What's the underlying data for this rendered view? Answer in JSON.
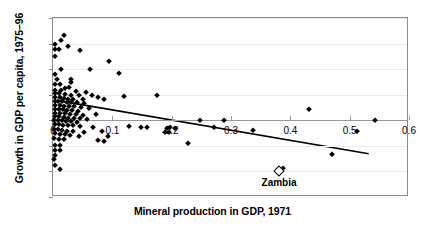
{
  "chart_data": {
    "type": "scatter",
    "title": "",
    "xlabel": "Mineral production in GDP, 1971",
    "ylabel": "Growth in GDP per capita, 1975–96",
    "xlim": [
      0,
      0.6
    ],
    "ylim": [
      -6,
      8
    ],
    "xticks": [
      "0",
      "0.1",
      "0.2",
      "0.3",
      "0.4",
      "0.5",
      "0.6"
    ],
    "xtick_values": [
      0,
      0.1,
      0.2,
      0.3,
      0.4,
      0.5,
      0.6
    ],
    "yticks": [
      "-6",
      "-4",
      "-2",
      "0",
      "2",
      "4",
      "6",
      "8"
    ],
    "ytick_values": [
      -6,
      -4,
      -2,
      0,
      2,
      4,
      6,
      8
    ],
    "grid": true,
    "legend": "none",
    "marker": "filled-diamond",
    "point_color": "#000000",
    "trendline": {
      "style": "solid",
      "color": "#000000",
      "x0": 0.011,
      "y0": 1.52,
      "x1": 0.532,
      "y1": -2.62
    },
    "annotations": [
      {
        "name": "Zambia",
        "x": 0.381,
        "y": -4.0,
        "marker": "hollow-diamond"
      }
    ],
    "points": [
      [
        0.004,
        6.0
      ],
      [
        0.013,
        6.3
      ],
      [
        0.019,
        6.7
      ],
      [
        0.025,
        5.8
      ],
      [
        0.004,
        5.6
      ],
      [
        0.01,
        5.6
      ],
      [
        0.046,
        5.5
      ],
      [
        0.003,
        5.0
      ],
      [
        0.095,
        4.6
      ],
      [
        0.004,
        3.6
      ],
      [
        0.013,
        4.0
      ],
      [
        0.062,
        4.0
      ],
      [
        0.112,
        3.7
      ],
      [
        0.006,
        3.2
      ],
      [
        0.03,
        3.2
      ],
      [
        0.031,
        3.0
      ],
      [
        0.004,
        2.8
      ],
      [
        0.012,
        2.8
      ],
      [
        0.027,
        2.6
      ],
      [
        0.02,
        2.5
      ],
      [
        0.004,
        2.4
      ],
      [
        0.013,
        2.4
      ],
      [
        0.038,
        2.3
      ],
      [
        0.055,
        2.25
      ],
      [
        0.003,
        2.1
      ],
      [
        0.01,
        2.1
      ],
      [
        0.021,
        2.05
      ],
      [
        0.03,
        2.0
      ],
      [
        0.044,
        2.0
      ],
      [
        0.065,
        1.95
      ],
      [
        0.12,
        1.9
      ],
      [
        0.175,
        1.95
      ],
      [
        0.004,
        1.8
      ],
      [
        0.011,
        1.8
      ],
      [
        0.018,
        1.75
      ],
      [
        0.026,
        1.7
      ],
      [
        0.034,
        1.7
      ],
      [
        0.05,
        1.65
      ],
      [
        0.075,
        1.8
      ],
      [
        0.086,
        1.7
      ],
      [
        0.003,
        1.5
      ],
      [
        0.009,
        1.5
      ],
      [
        0.016,
        1.5
      ],
      [
        0.023,
        1.45
      ],
      [
        0.03,
        1.4
      ],
      [
        0.04,
        1.4
      ],
      [
        0.052,
        1.35
      ],
      [
        0.004,
        1.2
      ],
      [
        0.011,
        1.2
      ],
      [
        0.018,
        1.15
      ],
      [
        0.027,
        1.1
      ],
      [
        0.036,
        1.1
      ],
      [
        0.048,
        1.05
      ],
      [
        0.06,
        1.0
      ],
      [
        0.003,
        0.9
      ],
      [
        0.01,
        0.9
      ],
      [
        0.017,
        0.85
      ],
      [
        0.024,
        0.8
      ],
      [
        0.032,
        0.8
      ],
      [
        0.042,
        0.75
      ],
      [
        0.432,
        0.9
      ],
      [
        0.004,
        0.6
      ],
      [
        0.012,
        0.6
      ],
      [
        0.02,
        0.55
      ],
      [
        0.028,
        0.5
      ],
      [
        0.038,
        0.5
      ],
      [
        0.05,
        0.45
      ],
      [
        0.072,
        0.5
      ],
      [
        0.003,
        0.3
      ],
      [
        0.01,
        0.3
      ],
      [
        0.018,
        0.25
      ],
      [
        0.026,
        0.2
      ],
      [
        0.035,
        0.2
      ],
      [
        0.045,
        0.15
      ],
      [
        0.058,
        0.1
      ],
      [
        0.002,
        0.05
      ],
      [
        0.008,
        0.0
      ],
      [
        0.015,
        0.0
      ],
      [
        0.022,
        -0.05
      ],
      [
        0.03,
        -0.05
      ],
      [
        0.04,
        -0.1
      ],
      [
        0.248,
        0.0
      ],
      [
        0.289,
        0.05
      ],
      [
        0.543,
        0.0
      ],
      [
        0.003,
        -0.3
      ],
      [
        0.01,
        -0.3
      ],
      [
        0.017,
        -0.35
      ],
      [
        0.025,
        -0.4
      ],
      [
        0.034,
        -0.4
      ],
      [
        0.046,
        -0.45
      ],
      [
        0.068,
        -0.5
      ],
      [
        0.128,
        -0.45
      ],
      [
        0.148,
        -0.5
      ],
      [
        0.158,
        -0.55
      ],
      [
        0.192,
        -0.6
      ],
      [
        0.198,
        -0.55
      ],
      [
        0.206,
        -0.6
      ],
      [
        0.272,
        -0.5
      ],
      [
        0.002,
        -0.7
      ],
      [
        0.009,
        -0.7
      ],
      [
        0.016,
        -0.75
      ],
      [
        0.024,
        -0.8
      ],
      [
        0.033,
        -0.85
      ],
      [
        0.052,
        -0.9
      ],
      [
        0.082,
        -0.85
      ],
      [
        0.188,
        -0.9
      ],
      [
        0.196,
        -0.95
      ],
      [
        0.337,
        -0.75
      ],
      [
        0.512,
        -0.8
      ],
      [
        0.003,
        -1.0
      ],
      [
        0.011,
        -1.05
      ],
      [
        0.02,
        -1.1
      ],
      [
        0.029,
        -1.15
      ],
      [
        0.044,
        -1.2
      ],
      [
        0.092,
        -1.25
      ],
      [
        0.002,
        -1.4
      ],
      [
        0.01,
        -1.45
      ],
      [
        0.018,
        -1.5
      ],
      [
        0.076,
        -1.55
      ],
      [
        0.086,
        -1.6
      ],
      [
        0.228,
        -1.75
      ],
      [
        0.004,
        -1.9
      ],
      [
        0.012,
        -1.95
      ],
      [
        0.003,
        -2.3
      ],
      [
        0.011,
        -2.35
      ],
      [
        0.004,
        -2.7
      ],
      [
        0.002,
        -3.0
      ],
      [
        0.003,
        -3.5
      ],
      [
        0.012,
        -3.8
      ],
      [
        0.388,
        -3.75
      ],
      [
        0.471,
        -2.6
      ]
    ]
  }
}
